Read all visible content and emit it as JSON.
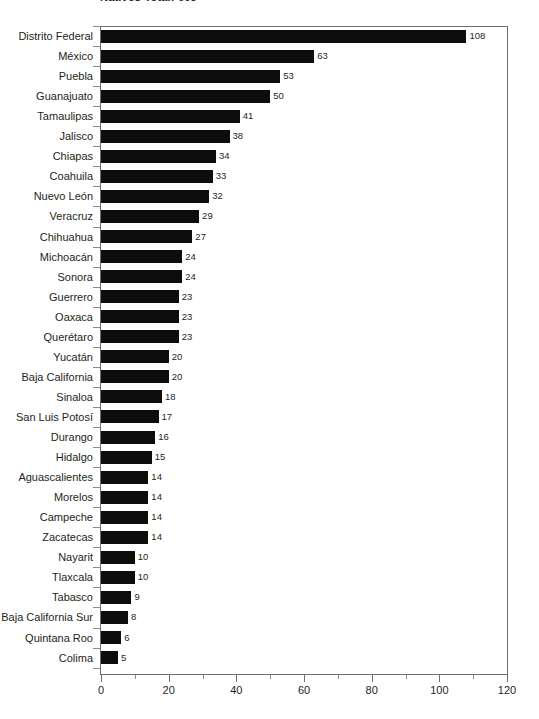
{
  "chart": {
    "title": "Nativos Total: 663",
    "xlabel": "",
    "ylabel": "",
    "xticks": [
      "0",
      "20",
      "40",
      "60",
      "80",
      "100",
      "120"
    ]
  },
  "chart_data": {
    "type": "bar",
    "orientation": "horizontal",
    "title": "Nativos Total: 663",
    "xlabel": "",
    "ylabel": "",
    "xlim": [
      0,
      120
    ],
    "xticks": [
      0,
      20,
      40,
      60,
      80,
      100,
      120
    ],
    "minor_tick_step": 10,
    "grid": false,
    "legend": null,
    "bar_color": "#0d0d0d",
    "axis_color": "#6f6f6f",
    "data_labels": true,
    "categories": [
      "Distrito Federal",
      "México",
      "Puebla",
      "Guanajuato",
      "Tamaulipas",
      "Jalisco",
      "Chiapas",
      "Coahuila",
      "Nuevo León",
      "Veracruz",
      "Chihuahua",
      "Michoacán",
      "Sonora",
      "Guerrero",
      "Oaxaca",
      "Querétaro",
      "Yucatán",
      "Baja California",
      "Sinaloa",
      "San Luis Potosí",
      "Durango",
      "Hidalgo",
      "Aguascalientes",
      "Morelos",
      "Campeche",
      "Zacatecas",
      "Nayarit",
      "Tlaxcala",
      "Tabasco",
      "Baja California Sur",
      "Quintana Roo",
      "Colima"
    ],
    "values": [
      108,
      63,
      53,
      50,
      41,
      38,
      34,
      33,
      32,
      29,
      27,
      24,
      24,
      23,
      23,
      23,
      20,
      20,
      18,
      17,
      16,
      15,
      14,
      14,
      14,
      14,
      10,
      10,
      9,
      8,
      6,
      5
    ]
  }
}
